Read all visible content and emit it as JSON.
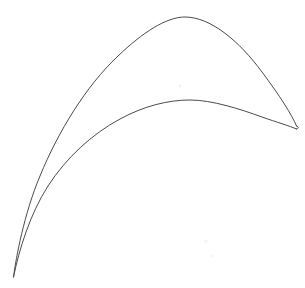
{
  "figure": {
    "kind": "line-drawing",
    "caption": "",
    "title": "",
    "labels": [],
    "annotations": [],
    "background_color": "#ffffff",
    "line_color": "#4a4a4a",
    "line_width_px": 1,
    "canvas": {
      "width": 305,
      "height": 288
    },
    "geometry": {
      "leading_edge_tip": {
        "x": 297,
        "y": 128,
        "shape": "narrow-rounded"
      },
      "trailing_edge_cusp": {
        "x": 13,
        "y": 277,
        "shape": "sharp-cusp"
      },
      "suction_side_apex": {
        "x": 180,
        "y": 17
      },
      "pressure_side_apex": {
        "x": 190,
        "y": 100
      },
      "chord_span_px": {
        "x_min": 12,
        "x_max": 298,
        "y_min": 16,
        "y_max": 279
      }
    },
    "paths": {
      "suction_surface": "M 13.5 277 C 16 258 24 214 40 176 C 58 132 86 86 118 56 C 142 33 166 17 185 17 C 211 17 240 42 262 72 C 280 96 292 115 296.5 126",
      "pressure_surface": "M 296.5 129 C 290 126 276 122 262 117 C 240 109 212 100 190 100 C 168 100 144 106 120 119 C 92 134 66 158 48 186 C 30 214 19 250 13.5 277",
      "leading_edge_cap": "M 296.5 126 C 299 127 299 128 296.5 129"
    },
    "specks": [
      {
        "x": 180,
        "y": 86,
        "r": 1.4,
        "color": "#f2f2f2"
      },
      {
        "x": 206,
        "y": 241,
        "r": 1.8,
        "color": "#f3f3f3"
      },
      {
        "x": 212,
        "y": 256,
        "r": 1.5,
        "color": "#f5f5f5"
      }
    ]
  }
}
